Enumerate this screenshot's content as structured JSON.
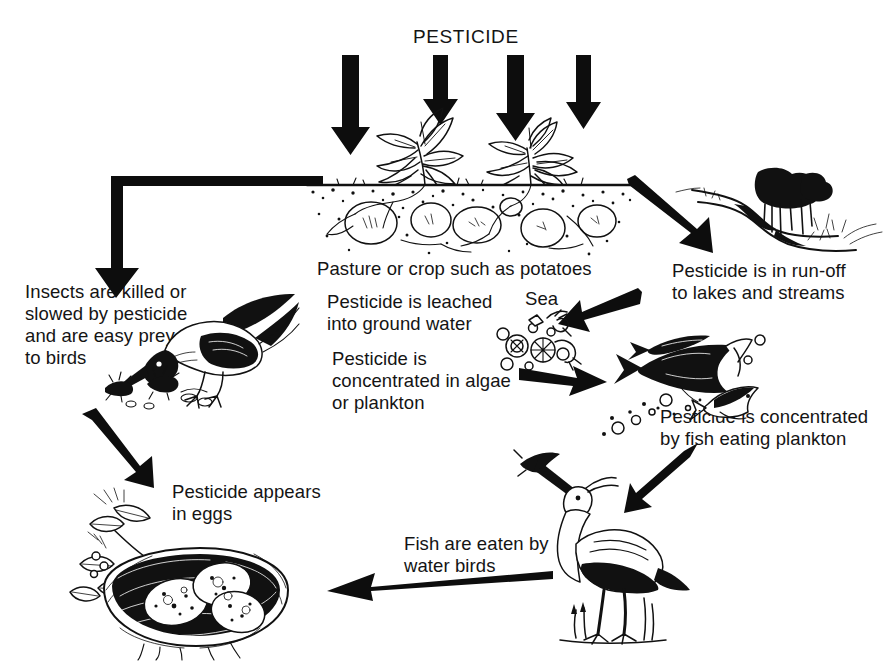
{
  "diagram": {
    "type": "flow-diagram",
    "style": "black-and-white pen-and-ink illustration"
  },
  "labels": {
    "pesticide": "PESTICIDE",
    "pasture": "Pasture or crop such as potatoes",
    "insects": "Insects are killed or\nslowed by pesticide\nand are easy prey\nto birds",
    "leached": "Pesticide is leached\ninto ground water",
    "sea": "Sea",
    "algae": "Pesticide is\nconcentrated in algae\nor plankton",
    "runoff": "Pesticide is in run-off\nto lakes and streams",
    "fish": "Pesticide is concentrated\nby fish eating plankton",
    "waterbirds": "Fish are eaten by\nwater birds",
    "eggs": "Pesticide appears\nin eggs"
  },
  "illustrations": [
    {
      "name": "potato-crop-field",
      "caption": "Pasture or crop such as potatoes"
    },
    {
      "name": "stream-landscape",
      "caption": "Pesticide is in run-off to lakes and streams"
    },
    {
      "name": "bird-eating-insects",
      "caption": "Insects are killed or slowed by pesticide and are easy prey to birds"
    },
    {
      "name": "plankton-algae",
      "caption": "Sea"
    },
    {
      "name": "fish-school",
      "caption": "Pesticide is concentrated by fish eating plankton"
    },
    {
      "name": "heron-with-fish",
      "caption": "Fish are eaten by water birds"
    },
    {
      "name": "nest-with-eggs",
      "caption": "Pesticide appears in eggs"
    }
  ],
  "arrows": [
    {
      "name": "pesticide-down-1",
      "direction": "down"
    },
    {
      "name": "pesticide-down-2",
      "direction": "down"
    },
    {
      "name": "pesticide-down-3",
      "direction": "down"
    },
    {
      "name": "pesticide-down-4",
      "direction": "down"
    },
    {
      "name": "field-to-insects",
      "direction": "left-then-down"
    },
    {
      "name": "field-to-runoff",
      "direction": "down-right"
    },
    {
      "name": "runoff-to-sea",
      "direction": "down-left"
    },
    {
      "name": "algae-to-fish",
      "direction": "right"
    },
    {
      "name": "fish-to-heron",
      "direction": "down-left"
    },
    {
      "name": "insects-to-nest",
      "direction": "down-right"
    },
    {
      "name": "heron-to-nest",
      "direction": "left"
    }
  ],
  "colors": {
    "ink": "#111111",
    "background": "#ffffff"
  }
}
